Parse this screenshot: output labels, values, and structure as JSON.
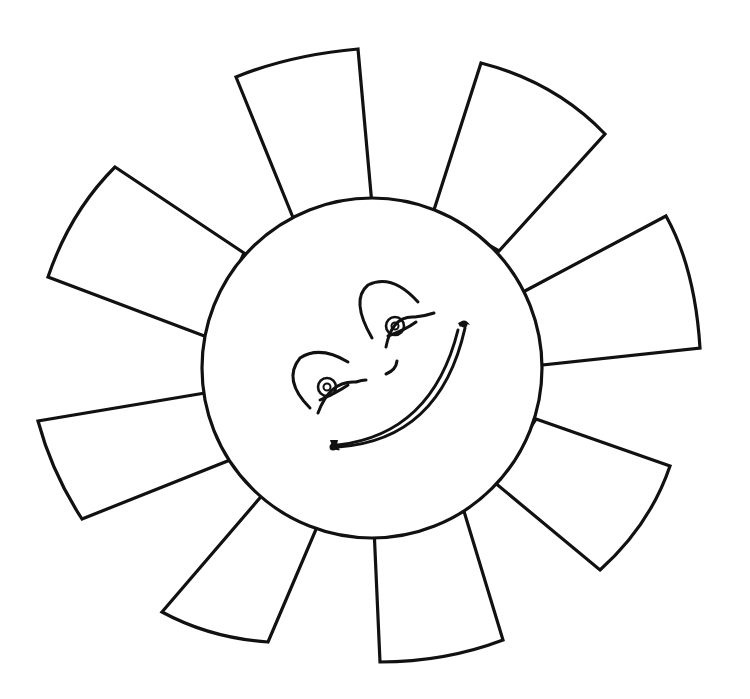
{
  "image": {
    "subject": "Smiling sun coloring page",
    "background_color": "#ffffff",
    "line_color": "#111111",
    "sun": {
      "center": [
        372,
        368
      ],
      "radius": 170,
      "ray_count": 11,
      "face": {
        "expression": "smile",
        "features": [
          "left-eye",
          "right-eye",
          "left-eyebrow",
          "right-eyebrow",
          "nose",
          "smile-mouth"
        ]
      }
    }
  }
}
